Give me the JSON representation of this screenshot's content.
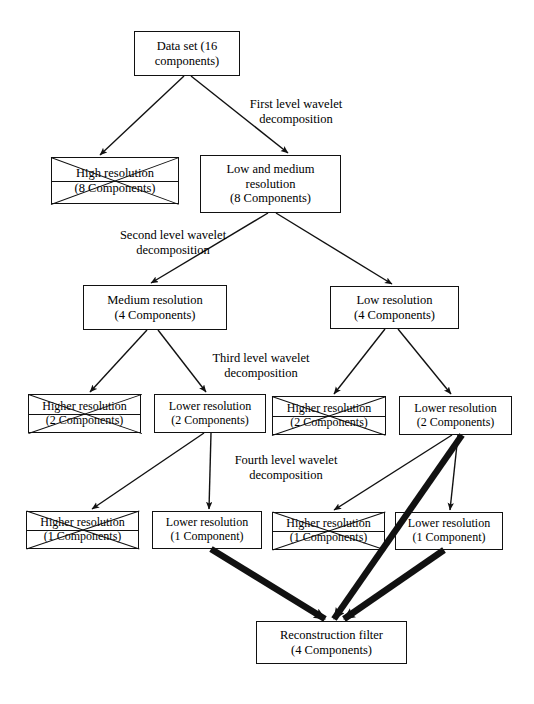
{
  "diagram": {
    "stroke_color": "#111111",
    "background": "#ffffff",
    "nodes": [
      {
        "id": "data-set",
        "line1": "Data set (16",
        "line2": "components)",
        "line3": "",
        "crossed": false,
        "x": 134,
        "y": 31,
        "w": 106,
        "h": 45,
        "font": 12.5
      },
      {
        "id": "high-resolution-8",
        "line1": "High resolution",
        "line2": "(8 Components)",
        "line3": "",
        "crossed": true,
        "x": 51,
        "y": 157,
        "w": 128,
        "h": 47,
        "font": 12.5
      },
      {
        "id": "low-medium-resolution-8",
        "line1": "Low and medium",
        "line2": "resolution",
        "line3": "(8 Components)",
        "crossed": false,
        "x": 200,
        "y": 155,
        "w": 141,
        "h": 58,
        "font": 12.5
      },
      {
        "id": "medium-resolution-4",
        "line1": "Medium resolution",
        "line2": "(4 Components)",
        "line3": "",
        "crossed": false,
        "x": 83,
        "y": 285,
        "w": 144,
        "h": 45,
        "font": 12.5
      },
      {
        "id": "low-resolution-4",
        "line1": "Low resolution",
        "line2": "(4 Components)",
        "line3": "",
        "crossed": false,
        "x": 330,
        "y": 286,
        "w": 129,
        "h": 43,
        "font": 12.5
      },
      {
        "id": "higher-resolution-2-a",
        "line1": "Higher resolution",
        "line2": "(2 Components)",
        "line3": "",
        "crossed": true,
        "x": 28,
        "y": 394,
        "w": 113,
        "h": 39,
        "font": 12
      },
      {
        "id": "lower-resolution-2-a",
        "line1": "Lower resolution",
        "line2": "(2 Components)",
        "line3": "",
        "crossed": false,
        "x": 154,
        "y": 394,
        "w": 112,
        "h": 39,
        "font": 12
      },
      {
        "id": "higher-resolution-2-b",
        "line1": "Higher resolution",
        "line2": "(2 Components)",
        "line3": "",
        "crossed": true,
        "x": 272,
        "y": 396,
        "w": 114,
        "h": 39,
        "font": 12
      },
      {
        "id": "lower-resolution-2-b",
        "line1": "Lower resolution",
        "line2": "(2 Components)",
        "line3": "",
        "crossed": false,
        "x": 399,
        "y": 396,
        "w": 113,
        "h": 39,
        "font": 12
      },
      {
        "id": "higher-resolution-1-a",
        "line1": "Higher resolution",
        "line2": "(1 Components)",
        "line3": "",
        "crossed": true,
        "x": 26,
        "y": 511,
        "w": 113,
        "h": 38,
        "font": 12
      },
      {
        "id": "lower-resolution-1-a",
        "line1": "Lower resolution",
        "line2": "(1 Component)",
        "line3": "",
        "crossed": false,
        "x": 152,
        "y": 511,
        "w": 110,
        "h": 38,
        "font": 12
      },
      {
        "id": "higher-resolution-1-b",
        "line1": "Higher resolution",
        "line2": "(1 Components)",
        "line3": "",
        "crossed": true,
        "x": 272,
        "y": 512,
        "w": 113,
        "h": 38,
        "font": 12
      },
      {
        "id": "lower-resolution-1-b",
        "line1": "Lower resolution",
        "line2": "(1 Component)",
        "line3": "",
        "crossed": false,
        "x": 395,
        "y": 512,
        "w": 108,
        "h": 38,
        "font": 12
      },
      {
        "id": "reconstruction-filter",
        "line1": "Reconstruction filter",
        "line2": "(4 Components)",
        "line3": "",
        "crossed": false,
        "x": 256,
        "y": 621,
        "w": 151,
        "h": 43,
        "font": 12.5
      }
    ],
    "edge_labels": [
      {
        "id": "first-level",
        "line1": "First level wavelet",
        "line2": "decomposition",
        "x": 216,
        "y": 97,
        "w": 160,
        "font": 12.5
      },
      {
        "id": "second-level",
        "line1": "Second level wavelet",
        "line2": "decomposition",
        "x": 88,
        "y": 228,
        "w": 170,
        "font": 12.5
      },
      {
        "id": "third-level",
        "line1": "Third level wavelet",
        "line2": "decomposition",
        "x": 181,
        "y": 351,
        "w": 160,
        "font": 12.5
      },
      {
        "id": "fourth-level",
        "line1": "Fourth level wavelet",
        "line2": "decomposition",
        "x": 203,
        "y": 453,
        "w": 166,
        "font": 12.5
      }
    ],
    "edges": [
      {
        "id": "dataset-to-high",
        "x1": 184,
        "y1": 76,
        "x2": 100,
        "y2": 155,
        "thick": false
      },
      {
        "id": "dataset-to-lowmedium",
        "x1": 191,
        "y1": 76,
        "x2": 288,
        "y2": 153,
        "thick": false
      },
      {
        "id": "lowmedium-to-medium",
        "x1": 268,
        "y1": 213,
        "x2": 151,
        "y2": 283,
        "thick": false
      },
      {
        "id": "lowmedium-to-low",
        "x1": 276,
        "y1": 213,
        "x2": 392,
        "y2": 284,
        "thick": false
      },
      {
        "id": "medium-to-higher2a",
        "x1": 147,
        "y1": 330,
        "x2": 90,
        "y2": 392,
        "thick": false
      },
      {
        "id": "medium-to-lower2a",
        "x1": 158,
        "y1": 330,
        "x2": 206,
        "y2": 392,
        "thick": false
      },
      {
        "id": "low-to-higher2b",
        "x1": 385,
        "y1": 329,
        "x2": 334,
        "y2": 394,
        "thick": false
      },
      {
        "id": "low-to-lower2b",
        "x1": 398,
        "y1": 329,
        "x2": 451,
        "y2": 394,
        "thick": false
      },
      {
        "id": "lower2a-to-higher1a",
        "x1": 204,
        "y1": 433,
        "x2": 92,
        "y2": 509,
        "thick": false
      },
      {
        "id": "lower2a-to-lower1a",
        "x1": 211,
        "y1": 433,
        "x2": 209,
        "y2": 509,
        "thick": false
      },
      {
        "id": "lower2b-to-higher1b",
        "x1": 452,
        "y1": 435,
        "x2": 334,
        "y2": 510,
        "thick": false
      },
      {
        "id": "lower2b-to-lower1b",
        "x1": 458,
        "y1": 435,
        "x2": 450,
        "y2": 510,
        "thick": false
      },
      {
        "id": "lower1a-to-reconstruct",
        "x1": 211,
        "y1": 549,
        "x2": 325,
        "y2": 619,
        "thick": true
      },
      {
        "id": "lower2b-to-reconstruct",
        "x1": 462,
        "y1": 435,
        "x2": 334,
        "y2": 619,
        "thick": true
      },
      {
        "id": "lower1b-to-reconstruct",
        "x1": 444,
        "y1": 550,
        "x2": 344,
        "y2": 619,
        "thick": true
      }
    ]
  }
}
